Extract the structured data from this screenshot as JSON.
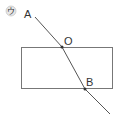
{
  "diagram": {
    "panel_label": "ウ",
    "points": {
      "A": {
        "label": "A"
      },
      "O": {
        "label": "O"
      },
      "B": {
        "label": "B"
      }
    },
    "colors": {
      "line": "#555555",
      "rect": "#666666",
      "circle_label": "#999999"
    }
  }
}
